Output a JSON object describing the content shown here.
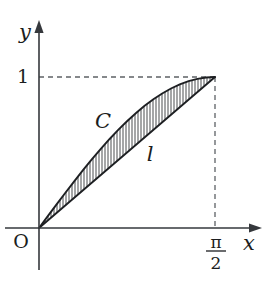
{
  "figure": {
    "background_color": "#ffffff",
    "ink_color": "#1d1f22",
    "dash_color": "#5d6166"
  },
  "axes": {
    "y_axis_label": "y",
    "x_axis_label": "x",
    "origin_label": "O",
    "y_tick_label": "1",
    "x_tick_numerator": "π",
    "x_tick_denominator": "2",
    "x_tick_value": "π/2",
    "origin_px": {
      "x": 39,
      "y": 228
    },
    "x_axis_start_px": 5,
    "x_axis_arrow_tip_px": 262,
    "y_axis_arrow_tip_px": 20,
    "y_axis_bottom_px": 270
  },
  "curves": [
    {
      "name": "C",
      "label": "C",
      "kind": "sine",
      "equation": "y = sin(x)",
      "label_px": {
        "x": 103,
        "y": 122
      }
    },
    {
      "name": "l",
      "label": "l",
      "kind": "chord",
      "equation": "y = (2/π) x",
      "label_px": {
        "x": 150,
        "y": 155
      }
    }
  ],
  "region": {
    "name": "hatched-lens",
    "description": "Region bounded above by curve C and below by line l",
    "hatch_pattern": "vertical",
    "hatch_spacing_px": 3
  },
  "key_points": [
    {
      "name": "origin",
      "x_label": "0",
      "y_label": "0",
      "px": {
        "x": 39,
        "y": 228
      }
    },
    {
      "name": "upper-right",
      "x_label": "π/2",
      "y_label": "1",
      "px": {
        "x": 215,
        "y": 77
      }
    }
  ],
  "chart_data": {
    "type": "line",
    "xlabel": "x",
    "ylabel": "y",
    "xlim": [
      0,
      1.5707963
    ],
    "ylim": [
      0,
      1
    ],
    "grid": false,
    "legend": "inline-labels",
    "xticks": [
      0,
      1.5707963
    ],
    "xticklabels": [
      "O",
      "π/2"
    ],
    "yticks": [
      1
    ],
    "yticklabels": [
      "1"
    ],
    "series": [
      {
        "name": "C",
        "equation": "y = sin(x)",
        "x": [
          0.0,
          0.0785,
          0.1571,
          0.2356,
          0.3142,
          0.3927,
          0.4712,
          0.5498,
          0.6283,
          0.7069,
          0.7854,
          0.8639,
          0.9425,
          1.021,
          1.0996,
          1.1781,
          1.2566,
          1.3352,
          1.4137,
          1.4923,
          1.5708
        ],
        "values": [
          0.0,
          0.0785,
          0.1564,
          0.2334,
          0.309,
          0.3827,
          0.454,
          0.5225,
          0.5878,
          0.6494,
          0.7071,
          0.7604,
          0.809,
          0.8526,
          0.891,
          0.9239,
          0.9511,
          0.9724,
          0.9877,
          0.9969,
          1.0
        ]
      },
      {
        "name": "l",
        "equation": "y = (2/π) x",
        "x": [
          0.0,
          1.5707963
        ],
        "values": [
          0.0,
          1.0
        ]
      }
    ],
    "annotations": [
      {
        "text": "C",
        "x": 0.58,
        "y": 0.7
      },
      {
        "text": "l",
        "x": 1.0,
        "y": 0.49
      }
    ]
  }
}
